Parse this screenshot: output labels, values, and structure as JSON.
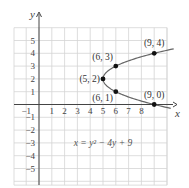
{
  "chart_data": {
    "type": "line",
    "title": "",
    "xlabel": "x",
    "ylabel": "y",
    "xlim": [
      -1,
      10
    ],
    "ylim": [
      -6,
      6
    ],
    "grid": true,
    "x_ticks": [
      "-1",
      "1",
      "2",
      "3",
      "4",
      "5",
      "6",
      "7",
      "8"
    ],
    "y_ticks": [
      "5",
      "4",
      "3",
      "2",
      "1",
      "-1",
      "-2",
      "-3",
      "-4",
      "-5"
    ],
    "equation": "x = y² − 4y + 9",
    "series": [
      {
        "name": "x = y^2 - 4y + 9",
        "curve": "parabola opening right",
        "vertex": [
          5,
          2
        ]
      }
    ],
    "points": [
      {
        "label": "(5, 2)",
        "x": 5,
        "y": 2
      },
      {
        "label": "(6, 3)",
        "x": 6,
        "y": 3
      },
      {
        "label": "(6, 1)",
        "x": 6,
        "y": 1
      },
      {
        "label": "(9, 4)",
        "x": 9,
        "y": 4
      },
      {
        "label": "(9, 0)",
        "x": 9,
        "y": 0
      }
    ]
  }
}
